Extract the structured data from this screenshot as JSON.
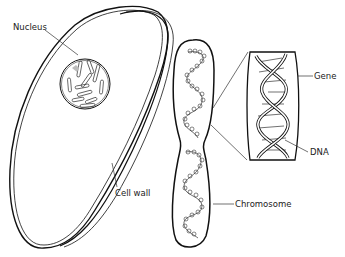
{
  "diagram": {
    "labels": {
      "nucleus": "Nucleus",
      "cell_wall": "Cell wall",
      "chromosome": "Chromosome",
      "gene": "Gene",
      "dna": "DNA"
    },
    "colors": {
      "ink": "#111111",
      "background": "#ffffff",
      "label_text": "#222222"
    },
    "parts": [
      {
        "id": "cell",
        "description": "Elongated egg-shaped cell with double-line cell wall"
      },
      {
        "id": "nucleus",
        "description": "Round nucleus with rod-shaped chromosomes inside"
      },
      {
        "id": "chromosome",
        "description": "Pinched capsule containing coiled chromatin"
      },
      {
        "id": "dna",
        "description": "Double helix segment shown in magnified box"
      },
      {
        "id": "gene",
        "description": "Section of DNA bracketed by the magnification box"
      }
    ]
  }
}
